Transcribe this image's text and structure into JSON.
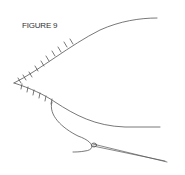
{
  "figure": {
    "title": "FIGURE 9",
    "line_color": "#555555"
  }
}
